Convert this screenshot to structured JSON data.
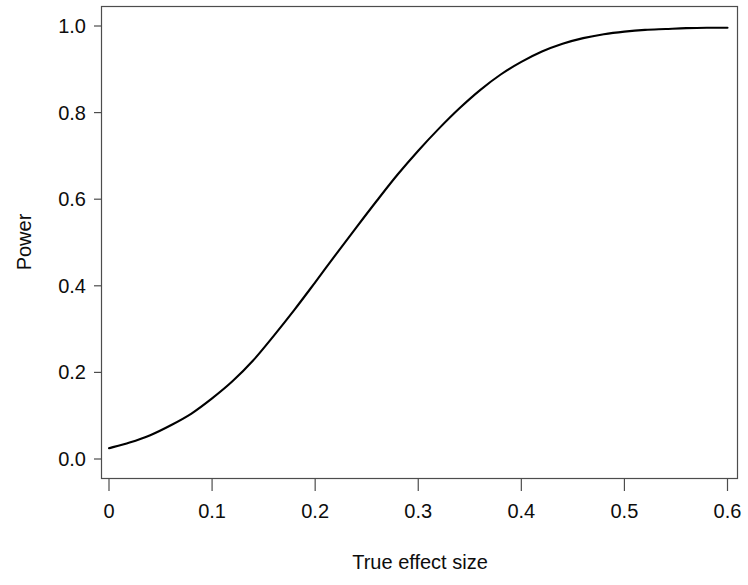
{
  "chart_data": {
    "type": "line",
    "title": "",
    "xlabel": "True effect size",
    "ylabel": "Power",
    "xlim": [
      0,
      0.6
    ],
    "ylim": [
      0,
      1.0
    ],
    "grid": false,
    "legend": null,
    "xticks": [
      0,
      0.1,
      0.2,
      0.3,
      0.4,
      0.5,
      0.6
    ],
    "xtick_labels": [
      "0",
      "0.1",
      "0.2",
      "0.3",
      "0.4",
      "0.5",
      "0.6"
    ],
    "yticks": [
      0.0,
      0.2,
      0.4,
      0.6,
      0.8,
      1.0
    ],
    "ytick_labels": [
      "0.0",
      "0.2",
      "0.4",
      "0.6",
      "0.8",
      "1.0"
    ],
    "line_color": "#000000",
    "line_width": 2.0,
    "series": [
      {
        "name": "Power",
        "x": [
          0.0,
          0.02,
          0.04,
          0.06,
          0.08,
          0.1,
          0.12,
          0.14,
          0.16,
          0.18,
          0.2,
          0.22,
          0.24,
          0.26,
          0.28,
          0.3,
          0.32,
          0.34,
          0.36,
          0.38,
          0.4,
          0.42,
          0.44,
          0.46,
          0.48,
          0.5,
          0.52,
          0.54,
          0.56,
          0.58,
          0.6
        ],
        "values": [
          0.025,
          0.038,
          0.055,
          0.078,
          0.105,
          0.14,
          0.18,
          0.228,
          0.285,
          0.345,
          0.408,
          0.472,
          0.535,
          0.597,
          0.657,
          0.712,
          0.763,
          0.81,
          0.852,
          0.888,
          0.917,
          0.941,
          0.959,
          0.972,
          0.981,
          0.987,
          0.991,
          0.993,
          0.995,
          0.996,
          0.996
        ]
      }
    ]
  },
  "axes": {
    "x_axis_name": "True effect size",
    "y_axis_name": "Power"
  }
}
